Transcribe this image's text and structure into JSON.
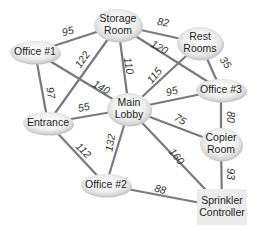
{
  "diagram": {
    "type": "weighted-graph",
    "colors": {
      "edge": "#7a7a7a",
      "node_fill": "#f2f2f2",
      "node_shadow": "#c8c8c8",
      "text": "#222222"
    },
    "nodes": [
      {
        "id": "storage",
        "label_lines": [
          "Storage",
          "Room"
        ],
        "x": 118,
        "y": 25,
        "rx": 24,
        "ry": 16,
        "shape": "ellipse"
      },
      {
        "id": "rest",
        "label_lines": [
          "Rest",
          "Rooms"
        ],
        "x": 200,
        "y": 43,
        "rx": 23,
        "ry": 16,
        "shape": "ellipse"
      },
      {
        "id": "office1",
        "label_lines": [
          "Office #1"
        ],
        "x": 35,
        "y": 52,
        "rx": 25,
        "ry": 11,
        "shape": "ellipse"
      },
      {
        "id": "office3",
        "label_lines": [
          "Office #3"
        ],
        "x": 221,
        "y": 90,
        "rx": 25,
        "ry": 11,
        "shape": "ellipse"
      },
      {
        "id": "entrance",
        "label_lines": [
          "Entrance"
        ],
        "x": 48,
        "y": 123,
        "rx": 25,
        "ry": 11,
        "shape": "ellipse"
      },
      {
        "id": "lobby",
        "label_lines": [
          "Main",
          "Lobby"
        ],
        "x": 129,
        "y": 109,
        "rx": 22,
        "ry": 16,
        "shape": "ellipse"
      },
      {
        "id": "copier",
        "label_lines": [
          "Copier",
          "Room"
        ],
        "x": 221,
        "y": 144,
        "rx": 21,
        "ry": 16,
        "shape": "ellipse"
      },
      {
        "id": "office2",
        "label_lines": [
          "Office #2"
        ],
        "x": 106,
        "y": 185,
        "rx": 25,
        "ry": 11,
        "shape": "ellipse"
      },
      {
        "id": "sprinkler",
        "label_lines": [
          "Sprinkler",
          "Controller"
        ],
        "x": 222,
        "y": 207,
        "w": 50,
        "h": 36,
        "shape": "rect"
      }
    ],
    "edges": [
      {
        "from": "office1",
        "to": "storage",
        "weight": "95",
        "lx": 68,
        "ly": 32,
        "rot": -15
      },
      {
        "from": "storage",
        "to": "rest",
        "weight": "82",
        "lx": 163,
        "ly": 23,
        "rot": 10
      },
      {
        "from": "storage",
        "to": "office3",
        "weight": "120",
        "lx": 159,
        "ly": 48,
        "rot": 30
      },
      {
        "from": "storage",
        "to": "entrance",
        "weight": "122",
        "lx": 83,
        "ly": 60,
        "rot": -55
      },
      {
        "from": "storage",
        "to": "lobby",
        "weight": "110",
        "lx": 128,
        "ly": 66,
        "rot": 80
      },
      {
        "from": "office1",
        "to": "entrance",
        "weight": "97",
        "lx": 50,
        "ly": 93,
        "rot": 80
      },
      {
        "from": "office1",
        "to": "lobby",
        "weight": "140",
        "lx": 101,
        "ly": 88,
        "rot": 30
      },
      {
        "from": "rest",
        "to": "office3",
        "weight": "35",
        "lx": 225,
        "ly": 63,
        "rot": 55
      },
      {
        "from": "rest",
        "to": "lobby",
        "weight": "115",
        "lx": 155,
        "ly": 76,
        "rot": -50
      },
      {
        "from": "lobby",
        "to": "office3",
        "weight": "95",
        "lx": 172,
        "ly": 92,
        "rot": -15
      },
      {
        "from": "entrance",
        "to": "lobby",
        "weight": "55",
        "lx": 84,
        "ly": 108,
        "rot": -12
      },
      {
        "from": "lobby",
        "to": "copier",
        "weight": "75",
        "lx": 180,
        "ly": 120,
        "rot": 30
      },
      {
        "from": "office3",
        "to": "copier",
        "weight": "80",
        "lx": 230,
        "ly": 117,
        "rot": 90
      },
      {
        "from": "entrance",
        "to": "office2",
        "weight": "112",
        "lx": 83,
        "ly": 151,
        "rot": 45
      },
      {
        "from": "lobby",
        "to": "office2",
        "weight": "132",
        "lx": 111,
        "ly": 143,
        "rot": -80
      },
      {
        "from": "lobby",
        "to": "sprinkler",
        "weight": "160",
        "lx": 176,
        "ly": 157,
        "rot": 50
      },
      {
        "from": "copier",
        "to": "sprinkler",
        "weight": "93",
        "lx": 230,
        "ly": 174,
        "rot": 90
      },
      {
        "from": "office2",
        "to": "sprinkler",
        "weight": "88",
        "lx": 160,
        "ly": 190,
        "rot": 15
      }
    ]
  }
}
